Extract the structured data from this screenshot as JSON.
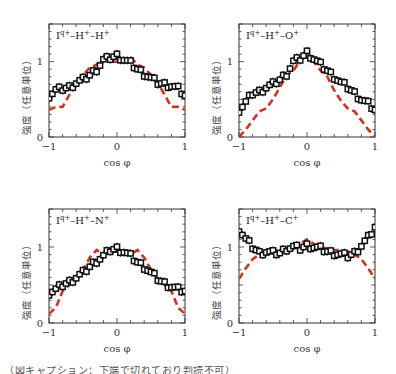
{
  "figure": {
    "caption_partial": "（図キャプション：下端で切れており判読不可）",
    "colors": {
      "experiment": "#111111",
      "theory": "#d0341f",
      "axis": "#333333"
    }
  },
  "chart_data": [
    {
      "type": "line",
      "panel": "top-left",
      "title": "I^{q+}–H^{+}–H^{+}",
      "title_text": "Iq+–H+–H+",
      "xlabel": "cos φ",
      "ylabel": "強度（任意単位）",
      "xlim": [
        -1,
        1
      ],
      "ylim": [
        0,
        1.5
      ],
      "xticks": [
        "−1",
        "0",
        "1"
      ],
      "yticks": [
        "0",
        "1"
      ],
      "grid": false,
      "series": [
        {
          "name": "experiment",
          "style": "open squares with error bars, black",
          "x": [
            -1.0,
            -0.9,
            -0.8,
            -0.7,
            -0.6,
            -0.5,
            -0.4,
            -0.3,
            -0.2,
            -0.1,
            0.0,
            0.1,
            0.2,
            0.3,
            0.4,
            0.5,
            0.6,
            0.7,
            0.8,
            0.9,
            1.0
          ],
          "y": [
            0.55,
            0.62,
            0.64,
            0.66,
            0.72,
            0.76,
            0.82,
            0.9,
            1.02,
            1.05,
            1.08,
            1.03,
            0.98,
            0.9,
            0.84,
            0.78,
            0.72,
            0.7,
            0.68,
            0.64,
            0.55
          ]
        },
        {
          "name": "theory",
          "style": "red dashed line",
          "x": [
            -1.0,
            -0.9,
            -0.8,
            -0.7,
            -0.6,
            -0.5,
            -0.4,
            -0.3,
            -0.2,
            -0.1,
            0.0,
            0.1,
            0.2,
            0.3,
            0.4,
            0.5,
            0.6,
            0.7,
            0.8,
            0.9,
            1.0
          ],
          "y": [
            0.36,
            0.4,
            0.4,
            0.56,
            0.72,
            0.82,
            0.92,
            0.96,
            1.06,
            1.0,
            1.0,
            1.0,
            1.06,
            0.96,
            0.92,
            0.82,
            0.72,
            0.56,
            0.4,
            0.4,
            0.36
          ]
        }
      ]
    },
    {
      "type": "line",
      "panel": "top-right",
      "title": "I^{q+}–H^{+}–O^{+}",
      "title_text": "Iq+–H+–O+",
      "xlabel": "cos φ",
      "ylabel": "強度（任意単位）",
      "xlim": [
        -1,
        1
      ],
      "ylim": [
        0,
        1.5
      ],
      "xticks": [
        "−1",
        "0",
        "1"
      ],
      "yticks": [
        "0",
        "1"
      ],
      "grid": false,
      "series": [
        {
          "name": "experiment",
          "style": "open squares with error bars, black",
          "x": [
            -1.0,
            -0.9,
            -0.8,
            -0.7,
            -0.6,
            -0.5,
            -0.4,
            -0.3,
            -0.2,
            -0.1,
            0.0,
            0.1,
            0.2,
            0.3,
            0.4,
            0.5,
            0.6,
            0.7,
            0.8,
            0.9,
            1.0
          ],
          "y": [
            0.36,
            0.46,
            0.58,
            0.6,
            0.66,
            0.7,
            0.76,
            0.84,
            1.0,
            1.04,
            1.12,
            1.04,
            0.96,
            0.88,
            0.8,
            0.72,
            0.66,
            0.58,
            0.5,
            0.44,
            0.36
          ]
        },
        {
          "name": "theory",
          "style": "red dashed line",
          "x": [
            -1.0,
            -0.9,
            -0.8,
            -0.7,
            -0.6,
            -0.5,
            -0.4,
            -0.3,
            -0.2,
            -0.1,
            0.0,
            0.1,
            0.2,
            0.3,
            0.4,
            0.5,
            0.6,
            0.7,
            0.8,
            0.9,
            1.0
          ],
          "y": [
            0.0,
            0.1,
            0.22,
            0.34,
            0.38,
            0.5,
            0.66,
            0.82,
            0.88,
            1.02,
            1.14,
            1.0,
            0.88,
            0.8,
            0.62,
            0.48,
            0.38,
            0.34,
            0.22,
            0.1,
            0.0
          ]
        }
      ]
    },
    {
      "type": "line",
      "panel": "bottom-left",
      "title": "I^{q+}–H^{+}–N^{+}",
      "title_text": "Iq+–H+–N+",
      "xlabel": "cos φ",
      "ylabel": "強度（任意単位）",
      "xlim": [
        -1,
        1
      ],
      "ylim": [
        0,
        1.5
      ],
      "xticks": [
        "−1",
        "0",
        "1"
      ],
      "yticks": [
        "0",
        "1"
      ],
      "grid": false,
      "series": [
        {
          "name": "experiment",
          "style": "open squares with error bars, black",
          "x": [
            -1.0,
            -0.9,
            -0.8,
            -0.7,
            -0.6,
            -0.5,
            -0.4,
            -0.3,
            -0.2,
            -0.1,
            0.0,
            0.1,
            0.2,
            0.3,
            0.4,
            0.5,
            0.6,
            0.7,
            0.8,
            0.9,
            1.0
          ],
          "y": [
            0.4,
            0.44,
            0.5,
            0.54,
            0.6,
            0.66,
            0.74,
            0.82,
            0.88,
            0.96,
            0.98,
            0.94,
            0.88,
            0.8,
            0.74,
            0.66,
            0.58,
            0.52,
            0.48,
            0.44,
            0.42
          ]
        },
        {
          "name": "theory",
          "style": "red dashed line",
          "x": [
            -1.0,
            -0.9,
            -0.8,
            -0.7,
            -0.6,
            -0.5,
            -0.4,
            -0.3,
            -0.2,
            -0.1,
            0.0,
            0.1,
            0.2,
            0.3,
            0.4,
            0.5,
            0.6,
            0.7,
            0.8,
            0.9,
            1.0
          ],
          "y": [
            0.12,
            0.2,
            0.42,
            0.5,
            0.58,
            0.7,
            0.86,
            0.96,
            0.9,
            0.94,
            0.94,
            0.92,
            0.9,
            0.96,
            0.86,
            0.7,
            0.58,
            0.5,
            0.42,
            0.2,
            0.12
          ]
        }
      ]
    },
    {
      "type": "line",
      "panel": "bottom-right",
      "title": "I^{q+}–H^{+}–C^{+}",
      "title_text": "Iq+–H+–C+",
      "xlabel": "cos φ",
      "ylabel": "強度（任意単位）",
      "xlim": [
        -1,
        1
      ],
      "ylim": [
        0,
        1.5
      ],
      "xticks": [
        "−1",
        "0",
        "1"
      ],
      "yticks": [
        "0",
        "1"
      ],
      "grid": false,
      "series": [
        {
          "name": "experiment",
          "style": "open squares with error bars, black",
          "x": [
            -1.0,
            -0.9,
            -0.8,
            -0.7,
            -0.6,
            -0.5,
            -0.4,
            -0.3,
            -0.2,
            -0.1,
            0.0,
            0.1,
            0.2,
            0.3,
            0.4,
            0.5,
            0.6,
            0.7,
            0.8,
            0.9,
            1.0
          ],
          "y": [
            1.24,
            1.1,
            1.0,
            0.92,
            0.94,
            0.92,
            0.92,
            0.98,
            1.0,
            0.98,
            1.02,
            1.0,
            0.98,
            0.94,
            0.92,
            0.9,
            0.88,
            0.92,
            1.02,
            1.12,
            1.26
          ]
        },
        {
          "name": "theory",
          "style": "red dashed line",
          "x": [
            -1.0,
            -0.9,
            -0.8,
            -0.7,
            -0.6,
            -0.5,
            -0.4,
            -0.3,
            -0.2,
            -0.1,
            0.0,
            0.1,
            0.2,
            0.3,
            0.4,
            0.5,
            0.6,
            0.7,
            0.8,
            0.9,
            1.0
          ],
          "y": [
            0.58,
            0.72,
            0.84,
            0.9,
            0.94,
            0.96,
            0.96,
            0.98,
            1.0,
            1.04,
            1.1,
            1.04,
            1.0,
            0.98,
            0.96,
            0.96,
            0.94,
            0.9,
            0.84,
            0.72,
            0.58
          ]
        }
      ]
    }
  ]
}
